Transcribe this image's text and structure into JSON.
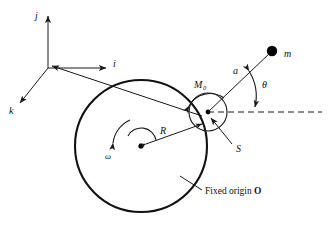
{
  "figure": {
    "background_color": "#ffffff",
    "line_color": "#111111",
    "width": 330,
    "height": 231
  },
  "axes": {
    "name": "body-frame-unit-vectors",
    "origin": {
      "x": 48,
      "y": 68
    },
    "vectors": [
      {
        "label": "j",
        "direction": "up",
        "tip": {
          "x": 48,
          "y": 14
        },
        "label_pos": {
          "x": 38,
          "y": 17
        }
      },
      {
        "label": "i",
        "direction": "right",
        "tip": {
          "x": 108,
          "y": 68
        },
        "label_pos": {
          "x": 113,
          "y": 66
        }
      },
      {
        "label": "k",
        "direction": "down-left",
        "tip": {
          "x": 18,
          "y": 104
        },
        "label_pos": {
          "x": 11,
          "y": 110
        }
      }
    ]
  },
  "big_circle": {
    "name": "disk",
    "center": {
      "x": 141,
      "y": 146
    },
    "radius": 66,
    "center_label": "Fixed origin O",
    "radius_label": "R",
    "spin_label": "ω"
  },
  "small_circle": {
    "name": "hub",
    "center": {
      "x": 208,
      "y": 112
    },
    "radius": 19,
    "moment_label": "M",
    "moment_subscript": "0"
  },
  "pivot": {
    "name": "point-S",
    "label": "S",
    "position": {
      "x": 208,
      "y": 112
    }
  },
  "rod": {
    "name": "pendulum-rod",
    "length_label": "a",
    "from": {
      "x": 208,
      "y": 112
    },
    "to": {
      "x": 272,
      "y": 51
    }
  },
  "mass": {
    "name": "point-mass-m",
    "label": "m",
    "position": {
      "x": 272,
      "y": 51
    },
    "radius": 5.2
  },
  "angle": {
    "name": "theta-angle",
    "label": "θ",
    "vertex": {
      "x": 208,
      "y": 112
    },
    "from_ray": "horizontal-dashed-reference",
    "to_ray": "pendulum-rod"
  },
  "reference_line": {
    "name": "horizontal-dashed-reference",
    "from": {
      "x": 208,
      "y": 112
    },
    "to": {
      "x": 322,
      "y": 112
    },
    "style": "dashed"
  },
  "labels": {
    "j": "j",
    "i": "i",
    "k": "k",
    "m": "m",
    "a": "a",
    "theta": "θ",
    "M": "M",
    "M_sub": "0",
    "R": "R",
    "omega": "ω",
    "S": "S",
    "fixed_origin_prefix": "Fixed origin ",
    "fixed_origin_symbol": "O"
  }
}
